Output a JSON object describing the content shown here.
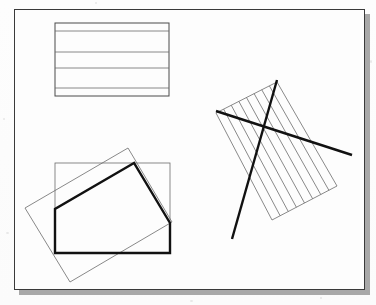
{
  "figure": {
    "canvas": {
      "width": 376,
      "height": 305
    },
    "panel": {
      "name": "figure-panel",
      "x": 14,
      "y": 9,
      "width": 351,
      "height": 281,
      "background_color": "#fdfdfd",
      "border_color": "#3a3a3a",
      "border_width": 1,
      "shadow_color": "#a8a8a8",
      "shadow_offset_x": 5,
      "shadow_offset_y": 5
    },
    "colors": {
      "thin_stroke": "#6b6b6b",
      "medium_stroke": "#4a4a4a",
      "thick_stroke": "#111111",
      "panel_border": "#3a3a3a",
      "shadow": "#a8a8a8",
      "background": "#fdfdfd"
    },
    "stroke_widths": {
      "thin": 0.8,
      "medium": 1.0,
      "thick": 2.4
    },
    "diagrams": [
      {
        "id": "hatched-rectangle-top-left",
        "label": "Horizontally hatched rectangle",
        "type": "rectangle-with-horizontal-hatch",
        "rect": {
          "x": 55,
          "y": 23,
          "width": 114,
          "height": 73
        },
        "hatch_orientation": "horizontal",
        "hatch_lines_y": [
          31,
          52,
          68,
          88
        ]
      },
      {
        "id": "rectangle-clip-bottom-left",
        "label": "Rectangle clipped by rotated rectangle",
        "type": "clip-intersection",
        "subject_rectangle": {
          "name": "axis-aligned-rectangle",
          "x": 55,
          "y": 163,
          "width": 115,
          "height": 90
        },
        "clip_rectangle": {
          "name": "rotated-rectangle",
          "points": [
            [
              128,
              148
            ],
            [
              25,
              208
            ],
            [
              70,
              282
            ],
            [
              172,
              222
            ]
          ]
        },
        "result_polygon": {
          "name": "intersection-polygon",
          "points": [
            [
              134,
              163
            ],
            [
              55,
              209
            ],
            [
              55,
              253
            ],
            [
              170,
              253
            ],
            [
              170,
              223
            ]
          ]
        }
      },
      {
        "id": "hatched-rotated-rectangle-right",
        "label": "Rotated hatched rectangle crossed by two bold lines",
        "type": "rotated-rect-with-hatch-and-lines",
        "rotated_rectangle": {
          "name": "rotated-hatched-rectangle",
          "points": [
            [
              277,
              82
            ],
            [
              216,
              113
            ],
            [
              272,
              220
            ],
            [
              337,
              186
            ]
          ]
        },
        "hatch_line_count": 7,
        "hatch_orientation": "parallel-to-short-edge",
        "bold_lines": [
          {
            "name": "bold-line-descending",
            "x1": 277,
            "y1": 80,
            "x2": 232,
            "y2": 239
          },
          {
            "name": "bold-line-ascending",
            "x1": 216,
            "y1": 111,
            "x2": 352,
            "y2": 155
          }
        ]
      }
    ]
  }
}
